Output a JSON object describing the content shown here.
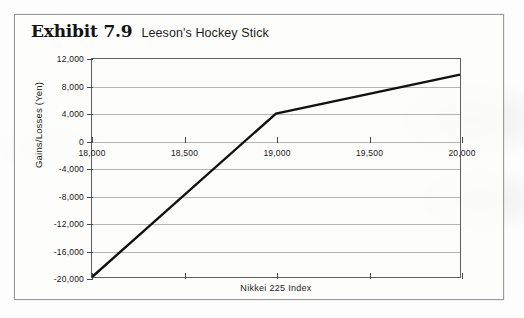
{
  "exhibit": {
    "number": "Exhibit 7.9",
    "subtitle": "Leeson's Hockey Stick"
  },
  "chart_data": {
    "type": "line",
    "title": "Leeson's Hockey Stick",
    "xlabel": "Nikkei 225 Index",
    "ylabel": "Gains/Losses (Yen)",
    "xlim": [
      18000,
      20000
    ],
    "ylim": [
      -20000,
      12000
    ],
    "grid": true,
    "legend": "none",
    "xticks": [
      18000,
      18500,
      19000,
      19500,
      20000
    ],
    "xtick_labels": [
      "18,000",
      "18,500",
      "19,000",
      "19,500",
      "20,000"
    ],
    "yticks": [
      12000,
      8000,
      4000,
      0,
      -4000,
      -8000,
      -12000,
      -16000,
      -20000
    ],
    "ytick_labels": [
      "12,000",
      "8,000",
      "4,000",
      "0",
      "-4,000",
      "-8,000",
      "-12,000",
      "-16,000",
      "-20,000"
    ],
    "series": [
      {
        "name": "Gains/Losses",
        "color": "#111111",
        "x": [
          18000,
          19000,
          20000
        ],
        "values": [
          -20000,
          4000,
          9700
        ]
      }
    ]
  }
}
